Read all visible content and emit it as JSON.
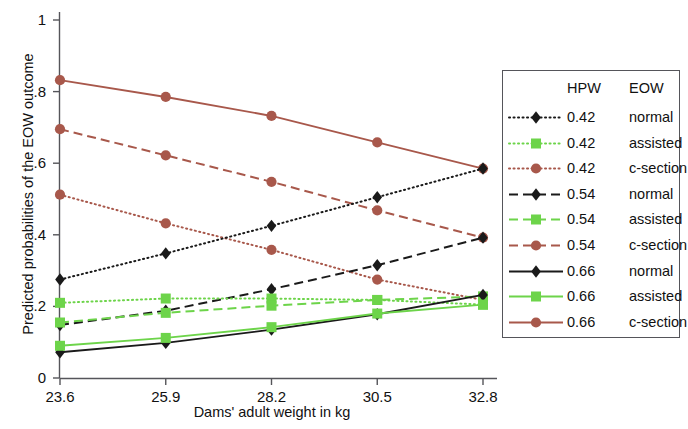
{
  "chart_data": {
    "type": "line",
    "title": "",
    "xlabel": "Dams' adult weight in kg",
    "ylabel": "Predicted probabilities of the EOW outcome",
    "x": [
      23.6,
      25.9,
      28.2,
      30.5,
      32.8
    ],
    "xticklabels": [
      "23.6",
      "25.9",
      "28.2",
      "30.5",
      "32.8"
    ],
    "yticklabels": [
      "0",
      ".2",
      ".4",
      ".6",
      ".8",
      "1"
    ],
    "ytickvalues": [
      0,
      0.2,
      0.4,
      0.6,
      0.8,
      1
    ],
    "xlim": [
      23.6,
      32.8
    ],
    "ylim": [
      0,
      1
    ],
    "grid": false,
    "legend_position": "right-outside",
    "series": [
      {
        "name": "0.42 normal",
        "hpw": "0.42",
        "eow": "normal",
        "color": "#1a1a1a",
        "dash": "dotted",
        "marker": "diamond",
        "values": [
          0.275,
          0.348,
          0.425,
          0.505,
          0.585
        ]
      },
      {
        "name": "0.42 assisted",
        "hpw": "0.42",
        "eow": "assisted",
        "color": "#6dd44a",
        "dash": "dotted",
        "marker": "square",
        "values": [
          0.21,
          0.222,
          0.222,
          0.218,
          0.205
        ]
      },
      {
        "name": "0.42 c-section",
        "hpw": "0.42",
        "eow": "c-section",
        "color": "#a8584b",
        "dash": "dotted",
        "marker": "circle",
        "values": [
          0.512,
          0.432,
          0.358,
          0.275,
          0.218
        ]
      },
      {
        "name": "0.54 normal",
        "hpw": "0.54",
        "eow": "normal",
        "color": "#1a1a1a",
        "dash": "dashed",
        "marker": "diamond",
        "values": [
          0.148,
          0.188,
          0.248,
          0.315,
          0.392
        ]
      },
      {
        "name": "0.54 assisted",
        "hpw": "0.54",
        "eow": "assisted",
        "color": "#6dd44a",
        "dash": "dashed",
        "marker": "square",
        "values": [
          0.155,
          0.182,
          0.202,
          0.218,
          0.228
        ]
      },
      {
        "name": "0.54 c-section",
        "hpw": "0.54",
        "eow": "c-section",
        "color": "#a8584b",
        "dash": "dashed",
        "marker": "circle",
        "values": [
          0.695,
          0.622,
          0.548,
          0.468,
          0.392
        ]
      },
      {
        "name": "0.66 normal",
        "hpw": "0.66",
        "eow": "normal",
        "color": "#1a1a1a",
        "dash": "solid",
        "marker": "diamond",
        "values": [
          0.072,
          0.098,
          0.135,
          0.178,
          0.232
        ]
      },
      {
        "name": "0.66 assisted",
        "hpw": "0.66",
        "eow": "assisted",
        "color": "#6dd44a",
        "dash": "solid",
        "marker": "square",
        "values": [
          0.09,
          0.112,
          0.142,
          0.18,
          0.205
        ]
      },
      {
        "name": "0.66 c-section",
        "hpw": "0.66",
        "eow": "c-section",
        "color": "#a8584b",
        "dash": "solid",
        "marker": "circle",
        "values": [
          0.832,
          0.785,
          0.732,
          0.658,
          0.585
        ]
      }
    ]
  },
  "axes": {
    "ylabel": "Predicted probabilities of the EOW outcome",
    "xlabel": "Dams' adult weight in kg",
    "yticks": [
      "1",
      ".8",
      ".6",
      ".4",
      ".2",
      "0"
    ],
    "xticks": [
      "23.6",
      "25.9",
      "28.2",
      "30.5",
      "32.8"
    ]
  },
  "legend": {
    "header_left": "HPW",
    "header_right": "EOW",
    "rows": [
      {
        "hpw": "0.42",
        "eow": "normal",
        "color": "#1a1a1a",
        "dash": "dotted",
        "marker": "diamond"
      },
      {
        "hpw": "0.42",
        "eow": "assisted",
        "color": "#6dd44a",
        "dash": "dotted",
        "marker": "square"
      },
      {
        "hpw": "0.42",
        "eow": "c-section",
        "color": "#a8584b",
        "dash": "dotted",
        "marker": "circle"
      },
      {
        "hpw": "0.54",
        "eow": "normal",
        "color": "#1a1a1a",
        "dash": "dashed",
        "marker": "diamond"
      },
      {
        "hpw": "0.54",
        "eow": "assisted",
        "color": "#6dd44a",
        "dash": "dashed",
        "marker": "square"
      },
      {
        "hpw": "0.54",
        "eow": "c-section",
        "color": "#a8584b",
        "dash": "dashed",
        "marker": "circle"
      },
      {
        "hpw": "0.66",
        "eow": "normal",
        "color": "#1a1a1a",
        "dash": "solid",
        "marker": "diamond"
      },
      {
        "hpw": "0.66",
        "eow": "assisted",
        "color": "#6dd44a",
        "dash": "solid",
        "marker": "square"
      },
      {
        "hpw": "0.66",
        "eow": "c-section",
        "color": "#a8584b",
        "dash": "solid",
        "marker": "circle"
      }
    ]
  },
  "colors": {
    "black": "#1a1a1a",
    "green": "#6dd44a",
    "brown": "#a8584b",
    "axis": "#55555a",
    "background": "#ffffff"
  }
}
